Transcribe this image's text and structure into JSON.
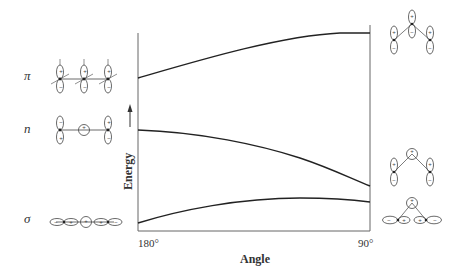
{
  "diagram": {
    "type": "Walsh correlation diagram",
    "x_axis": {
      "label": "Angle",
      "ticks": [
        "180°",
        "90°"
      ]
    },
    "y_axis": {
      "label": "Energy",
      "arrow": "up"
    },
    "orbitals": [
      {
        "symbol": "π",
        "left_geometry": "linear, three p orbitals perpendicular to axis",
        "right_geometry": "bent, three p orbitals"
      },
      {
        "symbol": "n",
        "left_geometry": "linear, two terminal p orbitals and central s orbital",
        "right_geometry": "bent, two terminal p orbitals and central s orbital"
      },
      {
        "symbol": "σ",
        "left_geometry": "linear, terminal p orbitals along axis with central s orbital",
        "right_geometry": "bent, terminal p orbitals along bonds with central s orbital"
      }
    ],
    "curves": [
      {
        "name": "π",
        "trend": "rises from 180° to 90°"
      },
      {
        "name": "n",
        "trend": "falls from 180° to 90°"
      },
      {
        "name": "σ",
        "trend": "rises slightly, max near ~110°, then slight drop"
      }
    ]
  },
  "labels": {
    "pi": "π",
    "n": "n",
    "sigma": "σ",
    "energy": "Energy",
    "angle": "Angle",
    "tick_left": "180°",
    "tick_right": "90°"
  },
  "signs": {
    "plus": "+",
    "minus": "−"
  },
  "colors": {
    "line": "#222222",
    "axis": "#666666",
    "background": "#ffffff"
  }
}
